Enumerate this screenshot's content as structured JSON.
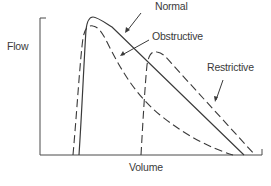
{
  "diagram": {
    "axes": {
      "y_label": "Flow",
      "x_label": "Volume"
    },
    "curves": [
      {
        "name": "Normal",
        "style": "solid",
        "label": "Normal"
      },
      {
        "name": "Obstructive",
        "style": "dashed",
        "label": "Obstructive"
      },
      {
        "name": "Restrictive",
        "style": "dashed",
        "label": "Restrictive"
      }
    ],
    "colors": {
      "line": "#3a3a3a",
      "background": "#ffffff"
    }
  }
}
